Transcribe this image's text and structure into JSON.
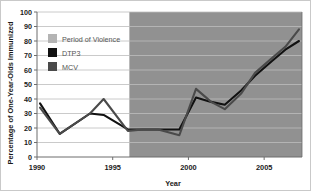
{
  "chart_data": {
    "type": "line",
    "title": "",
    "xlabel": "Year",
    "ylabel": "Percentage of One-Year-Olds Immunized",
    "xlim": [
      1990,
      2007.5
    ],
    "ylim": [
      0,
      100
    ],
    "xticks": [
      "1990",
      "1995",
      "2000",
      "2005"
    ],
    "xtick_values": [
      1990,
      1995,
      2000,
      2005
    ],
    "yticks": [
      "0",
      "10",
      "20",
      "30",
      "40",
      "50",
      "60",
      "70",
      "80",
      "90",
      "100"
    ],
    "ytick_values": [
      0,
      10,
      20,
      30,
      40,
      50,
      60,
      70,
      80,
      90,
      100
    ],
    "grid": "horizontal",
    "legend_position": "upper-left-inside",
    "x": [
      1990.2,
      1991.5,
      1993.5,
      1994.4,
      1996.0,
      1997.0,
      1998.0,
      1999.4,
      2000.5,
      2001.5,
      2002.4,
      2003.5,
      2004.4,
      2005.5,
      2006.4,
      2007.3
    ],
    "series": [
      {
        "name": "DTP3",
        "color": "#111111",
        "values": [
          37,
          16,
          30,
          29,
          19,
          19,
          19,
          19,
          41,
          38,
          36,
          46,
          56,
          66,
          74,
          80
        ]
      },
      {
        "name": "MCV",
        "color": "#4a4a4a",
        "values": [
          34,
          16,
          30,
          40,
          18,
          19,
          19,
          15,
          47,
          38,
          33,
          44,
          58,
          68,
          76,
          88
        ]
      }
    ],
    "shaded_region": {
      "name": "Period of Violence",
      "start": 1996.1,
      "end": 2007.5,
      "color": "#919191"
    },
    "plot_background": "#ffffff",
    "gridline_color": "#bdbdbd",
    "axis_color": "#6d6d6d"
  },
  "legend": {
    "items": [
      {
        "label": "Period of Violence",
        "swatch": "#b4b4b4"
      },
      {
        "label": "DTP3",
        "swatch": "#111111"
      },
      {
        "label": "MCV",
        "swatch": "#4a4a4a"
      }
    ]
  }
}
